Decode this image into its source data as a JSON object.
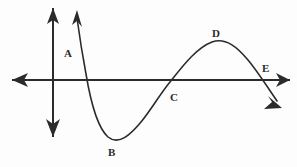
{
  "figure": {
    "background_color": "#fdfdfd",
    "stroke_color": "#2b2b2b",
    "axis_stroke_width": 2,
    "curve_stroke_width": 1.6
  },
  "axes": {
    "x_axis": {
      "name": "x-axis",
      "y": 80,
      "x_start": 12,
      "x_end": 290,
      "arrow_left": true,
      "arrow_right": true
    },
    "y_axis": {
      "name": "y-axis",
      "x": 53,
      "y_start": 8,
      "y_end": 137,
      "arrow_up": true,
      "arrow_down": true
    }
  },
  "curve": {
    "name": "sinusoidal-curve",
    "arrow_start": true,
    "arrow_end": true,
    "path": "M 77,18 C 80,40 83,58 86,74 C 91,104 98,128 108,137 C 119,146 131,134 141,122 C 151,110 160,94 170,82 C 182,67 196,48 212,42 C 226,37 238,48 248,60 C 258,72 268,88 277,101",
    "start_arrow_path": "M 72,25 L 77,10 L 82,27 L 77,21 Z",
    "end_arrow_path": "M 268,96 L 282,108 L 264,109 L 272,102 Z",
    "description": "Curve descends from upper left, troughs at B, rises through C, peaks at D, and descends through E off the lower right"
  },
  "labels": [
    {
      "id": "A",
      "text": "A",
      "x": 64,
      "y": 48,
      "note": "on the steep descending branch left of the first x-intercept"
    },
    {
      "id": "B",
      "text": "B",
      "x": 108,
      "y": 147,
      "note": "local minimum / trough of the curve"
    },
    {
      "id": "C",
      "text": "C",
      "x": 170,
      "y": 92,
      "note": "inflection point where curve crosses the x-axis"
    },
    {
      "id": "D",
      "text": "D",
      "x": 212,
      "y": 28,
      "note": "local maximum / peak of the curve"
    },
    {
      "id": "E",
      "text": "E",
      "x": 262,
      "y": 63,
      "note": "point where curve crosses the x-axis descending"
    }
  ]
}
